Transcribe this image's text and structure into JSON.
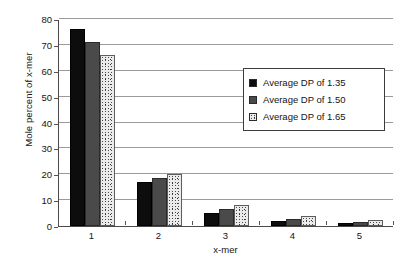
{
  "chart_data": {
    "type": "bar",
    "title": "",
    "xlabel": "x-mer",
    "ylabel": "Mole percent of x-mer",
    "categories": [
      "1",
      "2",
      "3",
      "4",
      "5"
    ],
    "ylim": [
      0,
      80
    ],
    "yticks": [
      0,
      10,
      20,
      30,
      40,
      50,
      60,
      70,
      80
    ],
    "ytick_labels": [
      "0",
      "10",
      "20",
      "30",
      "40",
      "50",
      "60",
      "70",
      "80"
    ],
    "grid": true,
    "legend_position": "upper right",
    "series": [
      {
        "name": "Average DP of 1.35",
        "color": "#0d0d0d",
        "values": [
          76,
          17,
          5.2,
          2.0,
          1.2
        ]
      },
      {
        "name": "Average DP of 1.50",
        "color": "#4a4a4a",
        "values": [
          71,
          18.5,
          6.5,
          2.7,
          1.7
        ]
      },
      {
        "name": "Average DP of 1.65",
        "color": "#ebebeb",
        "values": [
          66,
          20,
          8.0,
          3.7,
          2.2
        ]
      }
    ]
  },
  "legend": {
    "items": [
      {
        "label": "Average DP of 1.35"
      },
      {
        "label": "Average DP of 1.50"
      },
      {
        "label": "Average DP of 1.65"
      }
    ]
  },
  "axes": {
    "y_title": "Mole percent of x-mer",
    "x_title": "x-mer"
  }
}
